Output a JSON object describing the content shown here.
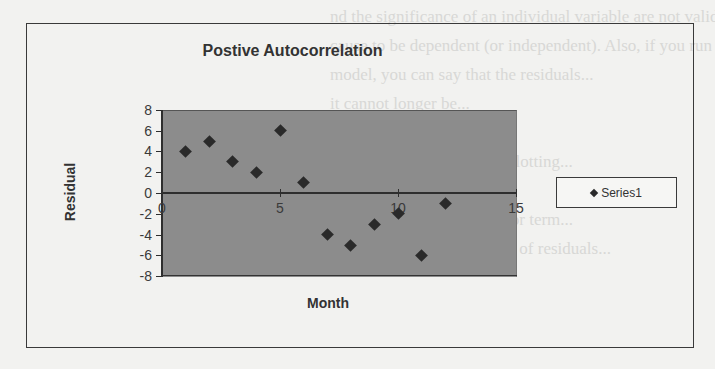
{
  "background_text": [
    "nd the significance of an individual variable are not valid",
    "cause to be dependent (or independent). Also, if you run a",
    "model, you can say that the residuals...",
    "it cannot longer be...",
    "",
    "...(within two standard...) Plotting...",
    "...your forecasts can...",
    "...expected value of the error term...",
    "...error is present if the plot of residuals..."
  ],
  "chart_data": {
    "type": "scatter",
    "title": "Postive Autocorrelation",
    "xlabel": "Month",
    "ylabel": "Residual",
    "xlim": [
      0,
      15
    ],
    "ylim": [
      -8,
      8
    ],
    "x_ticks": [
      0,
      5,
      10,
      15
    ],
    "y_ticks": [
      8,
      6,
      4,
      2,
      0,
      -2,
      -4,
      -6,
      -8
    ],
    "grid": false,
    "legend_position": "right",
    "plot_background": "#8c8c8c",
    "series": [
      {
        "name": "Series1",
        "marker": "diamond",
        "color": "#2a2a2a",
        "x": [
          1,
          2,
          3,
          4,
          5,
          6,
          7,
          8,
          9,
          10,
          11,
          12
        ],
        "y": [
          4,
          5,
          3,
          2,
          6,
          1,
          -4,
          -5,
          -3,
          -2,
          -6,
          -1
        ]
      }
    ]
  },
  "legend": {
    "label": "Series1"
  },
  "axis": {
    "y_labels": [
      "8",
      "6",
      "4",
      "2",
      "0",
      "-2",
      "-4",
      "-6",
      "-8"
    ],
    "x_labels": [
      "0",
      "5",
      "10",
      "15"
    ]
  }
}
